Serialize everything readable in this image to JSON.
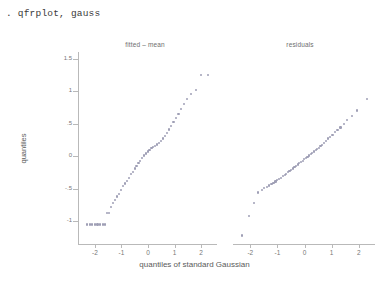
{
  "console": {
    "command": ". qfrplot, gauss"
  },
  "graph": {
    "y_axis_title": "quantiles",
    "x_axis_title": "quantiles of standard Gaussian",
    "y_ticks": [
      "1.5",
      "1",
      ".5",
      "0",
      "-.5",
      "-1"
    ],
    "y_tick_values": [
      1.5,
      1,
      0.5,
      0,
      -0.5,
      -1
    ],
    "x_ticks": [
      "-2",
      "-1",
      "0",
      "1",
      "2"
    ],
    "x_tick_values": [
      -2,
      -1,
      0,
      1,
      2
    ],
    "marker_color": "#8e8ea8",
    "axis_color": "#b9b9b9"
  },
  "chart_data": {
    "type": "scatter",
    "title": "",
    "xlabel": "quantiles of standard Gaussian",
    "ylabel": "quantiles",
    "xlim": [
      -2.6,
      2.6
    ],
    "ylim": [
      -1.35,
      1.6
    ],
    "grid": false,
    "legend": "none",
    "panels": [
      {
        "name": "fitted-mean",
        "title": "fitted – mean",
        "x": [
          -2.3,
          -2.2,
          -2.1,
          -2.0,
          -1.9,
          -1.8,
          -1.7,
          -1.62,
          -1.55,
          -1.48,
          -1.4,
          -1.32,
          -1.25,
          -1.18,
          -1.1,
          -1.02,
          -0.95,
          -0.88,
          -0.8,
          -0.72,
          -0.65,
          -0.58,
          -0.5,
          -0.43,
          -0.36,
          -0.29,
          -0.22,
          -0.15,
          -0.08,
          -0.01,
          0.06,
          0.13,
          0.2,
          0.27,
          0.34,
          0.41,
          0.48,
          0.56,
          0.64,
          0.72,
          0.8,
          0.88,
          0.96,
          1.05,
          1.15,
          1.25,
          1.36,
          1.48,
          1.62,
          1.8,
          2.0,
          2.25
        ],
        "y": [
          -1.05,
          -1.05,
          -1.05,
          -1.05,
          -1.05,
          -1.05,
          -1.05,
          -1.05,
          -0.88,
          -0.88,
          -0.78,
          -0.72,
          -0.68,
          -0.62,
          -0.58,
          -0.52,
          -0.46,
          -0.42,
          -0.38,
          -0.33,
          -0.28,
          -0.24,
          -0.19,
          -0.15,
          -0.11,
          -0.07,
          -0.03,
          0.01,
          0.04,
          0.07,
          0.1,
          0.12,
          0.14,
          0.16,
          0.18,
          0.2,
          0.23,
          0.27,
          0.31,
          0.36,
          0.41,
          0.46,
          0.52,
          0.58,
          0.65,
          0.72,
          0.8,
          0.88,
          0.96,
          1.02,
          1.25,
          1.25
        ]
      },
      {
        "name": "residuals",
        "title": "residuals",
        "x": [
          -2.3,
          -2.05,
          -1.85,
          -1.7,
          -1.58,
          -1.48,
          -1.38,
          -1.3,
          -1.22,
          -1.14,
          -1.07,
          -1.0,
          -0.93,
          -0.86,
          -0.79,
          -0.73,
          -0.67,
          -0.61,
          -0.55,
          -0.49,
          -0.43,
          -0.37,
          -0.31,
          -0.25,
          -0.19,
          -0.13,
          -0.07,
          -0.01,
          0.05,
          0.11,
          0.17,
          0.23,
          0.29,
          0.35,
          0.41,
          0.47,
          0.53,
          0.59,
          0.66,
          0.73,
          0.8,
          0.87,
          0.95,
          1.03,
          1.12,
          1.22,
          1.33,
          1.45,
          1.58,
          1.74,
          1.95,
          2.3
        ],
        "y": [
          -1.22,
          -0.92,
          -0.72,
          -0.56,
          -0.52,
          -0.49,
          -0.47,
          -0.45,
          -0.43,
          -0.41,
          -0.39,
          -0.37,
          -0.35,
          -0.33,
          -0.31,
          -0.29,
          -0.27,
          -0.25,
          -0.23,
          -0.21,
          -0.19,
          -0.17,
          -0.15,
          -0.13,
          -0.11,
          -0.09,
          -0.07,
          -0.05,
          -0.03,
          -0.01,
          0.01,
          0.03,
          0.05,
          0.07,
          0.09,
          0.11,
          0.13,
          0.15,
          0.17,
          0.2,
          0.23,
          0.27,
          0.3,
          0.33,
          0.37,
          0.4,
          0.44,
          0.49,
          0.55,
          0.62,
          0.7,
          0.88
        ]
      }
    ]
  }
}
